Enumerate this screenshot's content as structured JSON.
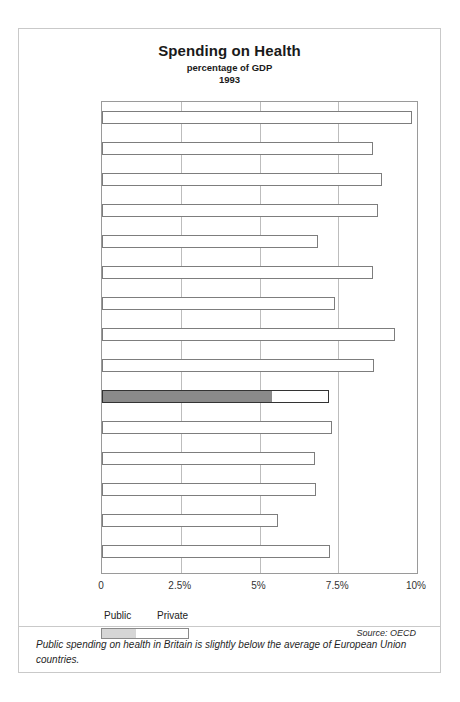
{
  "chart_data": {
    "type": "bar",
    "title": "Spending on Health",
    "subtitle": "percentage of GDP",
    "year": "1993",
    "xlabel": "",
    "ylabel": "",
    "xlim": [
      0,
      10
    ],
    "grid": true,
    "orientation": "horizontal",
    "tick_labels": [
      "0",
      "2.5%",
      "5%",
      "7.5%",
      "10%"
    ],
    "tick_values": [
      0,
      2.5,
      5,
      7.5,
      10
    ],
    "legend": {
      "position": "below-axis-left",
      "public_label": "Public",
      "private_label": "Private"
    },
    "categories": [
      "France",
      "Belgium",
      "Finland",
      "Netherlands",
      "Luxembourg",
      "Italy",
      "Sweden",
      "Austria",
      "Germany",
      "Britain",
      "Spain",
      "Denmark",
      "Ireland",
      "Greece",
      "Portugal"
    ],
    "values": [
      9.85,
      8.6,
      8.9,
      8.75,
      6.85,
      8.6,
      7.4,
      9.3,
      8.65,
      7.2,
      7.3,
      6.75,
      6.8,
      5.6,
      7.25
    ],
    "series": [
      {
        "name": "Public",
        "values": [
          null,
          null,
          null,
          null,
          null,
          null,
          null,
          null,
          null,
          5.4,
          null,
          null,
          null,
          null,
          null
        ]
      },
      {
        "name": "Total",
        "values": [
          9.85,
          8.6,
          8.9,
          8.75,
          6.85,
          8.6,
          7.4,
          9.3,
          8.65,
          7.2,
          7.3,
          6.75,
          6.8,
          5.6,
          7.25
        ]
      }
    ],
    "highlight": "Britain",
    "source": "Source: OECD",
    "annotation": "Public spending on health in Britain is slightly below the average of European Union countries."
  },
  "colors": {
    "public": "#8f8f8f",
    "private": "#ffffff",
    "bar_border": "#7d7d7d",
    "highlight_border": "#333333",
    "gridline": "#bdbdbd",
    "page_border": "#c9c9c9"
  }
}
